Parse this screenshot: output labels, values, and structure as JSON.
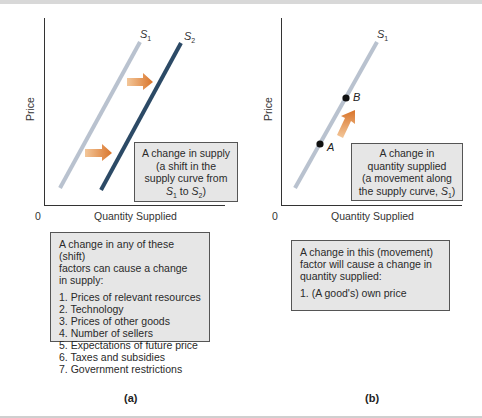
{
  "panel_a": {
    "axis": {
      "origin": "0",
      "x_label": "Quantity Supplied",
      "y_label": "Price"
    },
    "curves": [
      {
        "name": "S",
        "subscript": "1",
        "color": "#b9c2cf"
      },
      {
        "name": "S",
        "subscript": "2",
        "color": "#2c4a66"
      }
    ],
    "arrow_color": "#e08a3a",
    "callout": {
      "line1": "A change in supply",
      "line2": "(a shift in the",
      "line3": "supply curve from",
      "from_curve": "S",
      "from_sub": "1",
      "to_word": "to",
      "to_curve": "S",
      "to_sub": "2",
      "closing": ")"
    },
    "factor_box": {
      "intro_line1": "A change in any of these (shift)",
      "intro_line2": "factors can cause a change",
      "intro_line3": "in supply:",
      "items": [
        "1. Prices of relevant resources",
        "2. Technology",
        "3. Prices of other goods",
        "4. Number of sellers",
        "5. Expectations of future price",
        "6. Taxes and subsidies",
        "7. Government restrictions"
      ]
    },
    "label": "(a)"
  },
  "panel_b": {
    "axis": {
      "origin": "0",
      "x_label": "Quantity Supplied",
      "y_label": "Price"
    },
    "curves": [
      {
        "name": "S",
        "subscript": "1",
        "color": "#b9c2cf"
      }
    ],
    "points": [
      {
        "label": "A"
      },
      {
        "label": "B"
      }
    ],
    "arrow_color": "#e08a3a",
    "callout": {
      "line1": "A change in",
      "line2": "quantity supplied",
      "line3": "(a movement along",
      "line4_prefix": "the supply curve, ",
      "curve": "S",
      "curve_sub": "1",
      "closing": ")"
    },
    "factor_box": {
      "intro_line1": "A change in this (movement)",
      "intro_line2": "factor will cause a change in",
      "intro_line3": "quantity supplied:",
      "items": [
        "1. (A good's) own price"
      ]
    },
    "label": "(b)"
  }
}
